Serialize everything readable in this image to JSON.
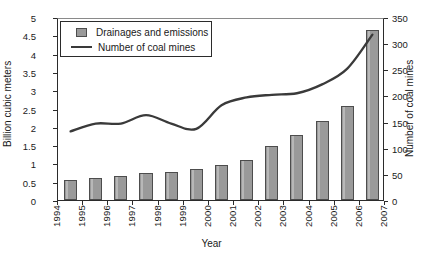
{
  "chart_data": {
    "type": "bar",
    "title": "",
    "xlabel": "Year",
    "ylabel": "Billion cubic meters",
    "y2label": "Number of coal mines",
    "grid": false,
    "legend_position": "upper-left-inside",
    "categories": [
      "1994",
      "1995",
      "1996",
      "1997",
      "1998",
      "1999",
      "2000",
      "2001",
      "2002",
      "2003",
      "2004",
      "2005",
      "2006"
    ],
    "xtick_labels": [
      "1994",
      "1995",
      "1996",
      "1997",
      "1998",
      "1999",
      "2000",
      "2001",
      "2002",
      "2003",
      "2004",
      "2005",
      "2006",
      "2007"
    ],
    "ylim": [
      0,
      5
    ],
    "ytick_labels": [
      "0",
      "0.5",
      "1",
      "1.5",
      "2",
      "2.5",
      "3",
      "3.5",
      "4",
      "4.5",
      "5"
    ],
    "y2lim": [
      0,
      350
    ],
    "y2tick_labels": [
      "0",
      "50",
      "100",
      "150",
      "200",
      "250",
      "300",
      "350"
    ],
    "series": [
      {
        "name": "Drainages and emissions",
        "type": "bar",
        "axis": "left",
        "unit": "Billion cubic meters",
        "color": "#9a9a9a",
        "edge_color": "#4d4d4d",
        "values": [
          0.55,
          0.6,
          0.65,
          0.73,
          0.77,
          0.84,
          0.97,
          1.1,
          1.48,
          1.78,
          2.17,
          2.57,
          4.65
        ]
      },
      {
        "name": "Number of coal mines",
        "type": "line",
        "axis": "right",
        "unit": "mines",
        "color": "#3a3a3a",
        "values": [
          135,
          150,
          150,
          166,
          150,
          140,
          185,
          200,
          205,
          208,
          225,
          255,
          320
        ]
      }
    ]
  },
  "legend": {
    "items": [
      {
        "label": "Drainages and emissions",
        "marker": "square-swatch"
      },
      {
        "label": "Number of coal mines",
        "marker": "line-swatch"
      }
    ]
  }
}
